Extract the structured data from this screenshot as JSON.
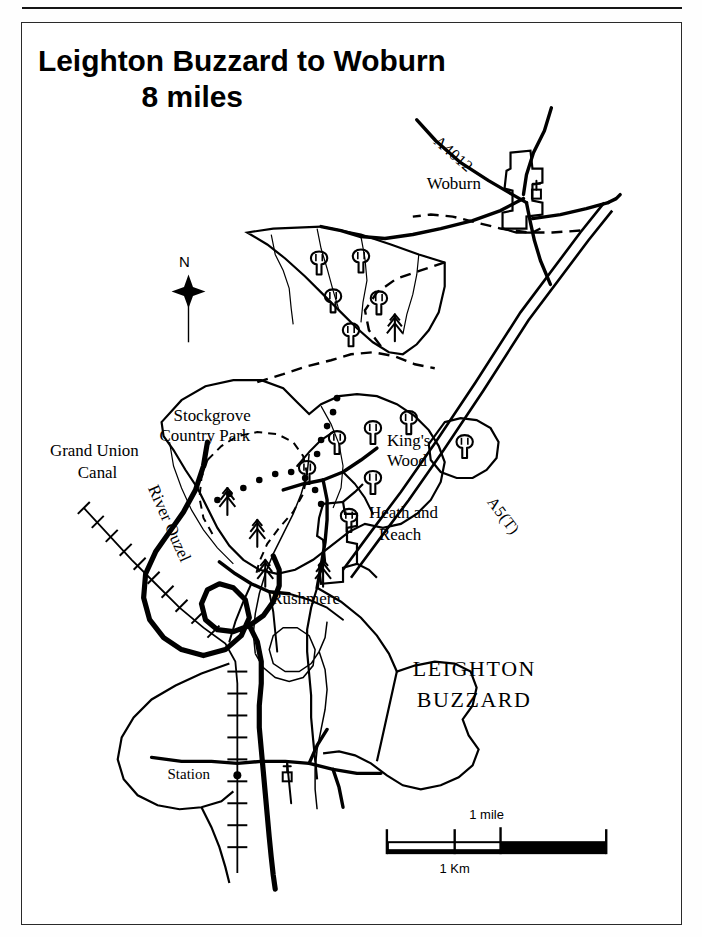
{
  "document": {
    "type": "route-map",
    "title_line1": "Leighton Buzzard to Woburn",
    "title_line2": "8 miles"
  },
  "map": {
    "north_arrow": {
      "label": "N",
      "icon": "north-arrow-icon"
    },
    "scale_bar": {
      "mile_label": "1 mile",
      "km_label": "1 Km"
    },
    "place_labels": [
      {
        "name": "woburn",
        "text": "Woburn",
        "style": "serif"
      },
      {
        "name": "stockgrove-country-park-line1",
        "text": "Stockgrove",
        "style": "serif"
      },
      {
        "name": "stockgrove-country-park-line2",
        "text": "Country Park",
        "style": "serif"
      },
      {
        "name": "kings-wood-line1",
        "text": "King's",
        "style": "serif"
      },
      {
        "name": "kings-wood-line2",
        "text": "Wood",
        "style": "serif"
      },
      {
        "name": "heath-and-reach-line1",
        "text": "Heath and",
        "style": "serif"
      },
      {
        "name": "heath-and-reach-line2",
        "text": "Reach",
        "style": "serif"
      },
      {
        "name": "rushmere",
        "text": "Rushmere",
        "style": "serif"
      },
      {
        "name": "leighton-buzzard-line1",
        "text": "LEIGHTON",
        "style": "serif-caps"
      },
      {
        "name": "leighton-buzzard-line2",
        "text": "BUZZARD",
        "style": "serif-caps"
      },
      {
        "name": "station",
        "text": "Station",
        "style": "serif-small"
      }
    ],
    "waterway_labels": [
      {
        "name": "grand-union-canal-line1",
        "text": "Grand Union"
      },
      {
        "name": "grand-union-canal-line2",
        "text": "Canal"
      },
      {
        "name": "river-ouzel",
        "text": "River Ouzel"
      }
    ],
    "road_labels": [
      {
        "name": "road-label-a4012",
        "text": "A4012"
      },
      {
        "name": "road-label-a5t",
        "text": "A5(T)"
      }
    ],
    "symbols": [
      {
        "name": "church-symbol-woburn",
        "icon": "church-icon"
      },
      {
        "name": "church-symbol-leighton-buzzard",
        "icon": "church-icon"
      },
      {
        "name": "station-marker",
        "icon": "station-dot-icon"
      },
      {
        "name": "deciduous-tree-symbol",
        "icon": "broadleaf-tree-icon"
      },
      {
        "name": "conifer-tree-symbol",
        "icon": "conifer-tree-icon"
      }
    ],
    "colors": {
      "ink": "#000000",
      "paper": "#ffffff",
      "frame": "#2a2a2a"
    }
  }
}
